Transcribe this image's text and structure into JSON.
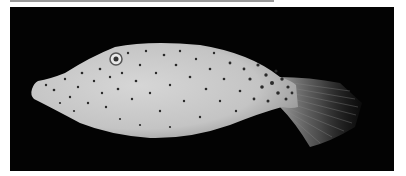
{
  "image": {
    "subject": "spotted filefish specimen, lateral view",
    "background_color": "#030303",
    "body_color": "#c9c9c9",
    "spot_color": "#2a2a2a",
    "frame": {
      "x": 10,
      "y": 7,
      "width": 384,
      "height": 164
    }
  },
  "top_rule": {
    "color": "#9a9a9a",
    "x": 10,
    "width": 264
  }
}
